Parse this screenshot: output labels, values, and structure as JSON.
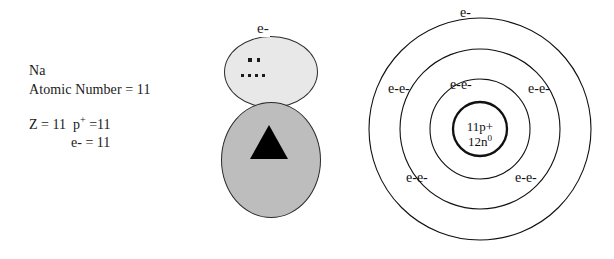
{
  "diagram": {
    "title_element": "Na",
    "info": {
      "symbol": "Na",
      "atomic_number_line": "Atomic Number = 11",
      "z_line_prefix": "Z = 11  p",
      "z_line_suffix": " =11",
      "z_superscript": "+",
      "electron_count_line": "e- = 11"
    },
    "blob": {
      "electron_label": "e-",
      "shell_fill": "#e8e8e8",
      "core_fill": "#bdbdbd",
      "triangle_fill": "#000000",
      "outline_color": "#2b2b2b",
      "top_dot_count": 2,
      "bottom_dot_count": 4
    },
    "bohr": {
      "nucleus_protons": "11p+",
      "nucleus_neutrons_prefix": "12n",
      "nucleus_neutrons_superscript": "0",
      "ring_color": "#111111",
      "labels": [
        {
          "text": "e-",
          "x": 108,
          "y": 6
        },
        {
          "text": "e-e-",
          "x": 36,
          "y": 82
        },
        {
          "text": "e-e-",
          "x": 98,
          "y": 78
        },
        {
          "text": "e-e-",
          "x": 176,
          "y": 82
        },
        {
          "text": "e-e-",
          "x": 54,
          "y": 171
        },
        {
          "text": "e-e-",
          "x": 163,
          "y": 171
        }
      ],
      "shell_radii": [
        111,
        80,
        50,
        27
      ],
      "center": {
        "x": 128,
        "y": 129
      }
    }
  }
}
